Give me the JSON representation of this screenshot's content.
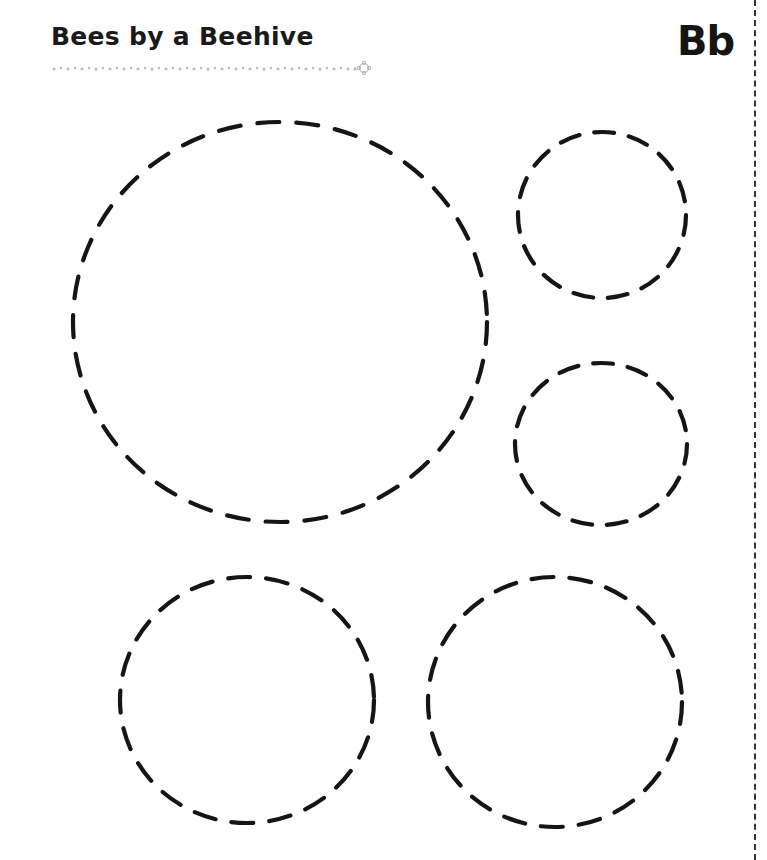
{
  "worksheet": {
    "title": "Bees by a Beehive",
    "letter": "Bb",
    "decoration": {
      "dotted_rule": "flower-dotted-underline",
      "end_icon": "flower-icon"
    },
    "cut_line": "dashed-vertical-border",
    "tracing_circles": [
      {
        "id": "large-circle",
        "label": "beehive-circle",
        "cx": 280,
        "cy": 322,
        "rx": 207,
        "ry": 200
      },
      {
        "id": "small-circle-top-right",
        "label": "bee-circle-1",
        "cx": 602,
        "cy": 215,
        "rx": 84,
        "ry": 83
      },
      {
        "id": "small-circle-middle-right",
        "label": "bee-circle-2",
        "cx": 601,
        "cy": 444,
        "rx": 86,
        "ry": 81
      },
      {
        "id": "medium-circle-bottom-left",
        "label": "bee-circle-3",
        "cx": 247,
        "cy": 700,
        "rx": 127,
        "ry": 123
      },
      {
        "id": "medium-circle-bottom-right",
        "label": "bee-circle-4",
        "cx": 555,
        "cy": 702,
        "rx": 127,
        "ry": 125
      }
    ],
    "colors": {
      "ink": "#151515",
      "decoration": "#b8b8b8",
      "background": "#fefefe"
    }
  }
}
